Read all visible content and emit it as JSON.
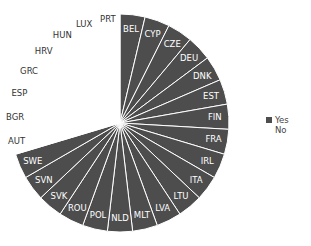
{
  "chart_data": {
    "type": "pie",
    "title": "",
    "start_angle": "12 o'clock, clockwise",
    "categories": [
      "BEL",
      "CYP",
      "CZE",
      "DEU",
      "DNK",
      "EST",
      "FIN",
      "FRA",
      "IRL",
      "ITA",
      "LTU",
      "LVA",
      "MLT",
      "NLD",
      "POL",
      "ROU",
      "SVK",
      "SVN",
      "SWE",
      "AUT",
      "BGR",
      "ESP",
      "GRC",
      "HRV",
      "HUN",
      "LUX",
      "PRT"
    ],
    "values": [
      1,
      1,
      1,
      1,
      1,
      1,
      1,
      1,
      1,
      1,
      1,
      1,
      1,
      1,
      1,
      1,
      1,
      1,
      1,
      1,
      1,
      1,
      1,
      1,
      1,
      1,
      1
    ],
    "group": [
      "Yes",
      "Yes",
      "Yes",
      "Yes",
      "Yes",
      "Yes",
      "Yes",
      "Yes",
      "Yes",
      "Yes",
      "Yes",
      "Yes",
      "Yes",
      "Yes",
      "Yes",
      "Yes",
      "Yes",
      "Yes",
      "Yes",
      "No",
      "No",
      "No",
      "No",
      "No",
      "No",
      "No",
      "No"
    ],
    "legend": [
      {
        "label": "Yes",
        "color": "#4d4d4d"
      },
      {
        "label": "No",
        "color": "#ffffff"
      }
    ],
    "legend_position": "right"
  },
  "legend": {
    "yes_label": "Yes",
    "no_label": "No"
  },
  "colors": {
    "yes": "#4d4d4d",
    "no": "#ffffff",
    "separator": "#ffffff"
  }
}
